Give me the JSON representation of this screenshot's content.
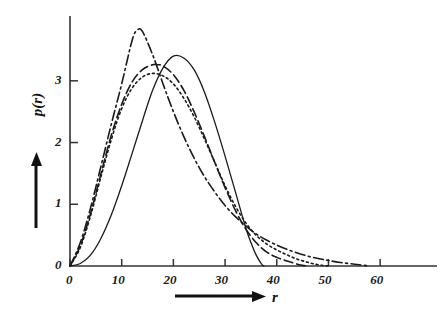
{
  "figure": {
    "background_color": "#ffffff",
    "line_color": "#1a1a1a",
    "axis_color": "#333333"
  },
  "axes": {
    "x_axis_label": "r",
    "y_axis_label": "p(r)",
    "x_ticks": [
      "0",
      "10",
      "20",
      "30",
      "40",
      "50",
      "60"
    ],
    "y_ticks": [
      "0",
      "1",
      "2",
      "3"
    ],
    "x_arrow_icon": "right-arrow-icon",
    "y_arrow_icon": "up-arrow-icon"
  },
  "chart_data": {
    "type": "line",
    "title": "",
    "xlabel": "r",
    "ylabel": "p(r)",
    "xlim": [
      0,
      71
    ],
    "ylim": [
      0,
      4.05
    ],
    "xticks": [
      0,
      10,
      20,
      30,
      40,
      50,
      60
    ],
    "yticks": [
      0,
      1,
      2,
      3
    ],
    "grid": false,
    "legend": "none",
    "series": [
      {
        "name": "solid",
        "style": "solid",
        "peak_x": 20,
        "peak_y": 3.4,
        "x": [
          0,
          2,
          4,
          6,
          8,
          10,
          12,
          14,
          16,
          18,
          20,
          22,
          24,
          26,
          28,
          30,
          32,
          34,
          35,
          36,
          37,
          37.5
        ],
        "values": [
          0,
          0.04,
          0.18,
          0.45,
          0.83,
          1.3,
          1.82,
          2.35,
          2.85,
          3.21,
          3.4,
          3.37,
          3.18,
          2.82,
          2.33,
          1.78,
          1.2,
          0.62,
          0.38,
          0.18,
          0.04,
          0
        ]
      },
      {
        "name": "dash-dot-tall",
        "style": "dash-dot",
        "peak_x": 13,
        "peak_y": 3.82,
        "x": [
          0,
          2,
          4,
          6,
          8,
          10,
          12,
          13,
          14,
          16,
          18,
          20,
          22,
          24,
          26,
          28,
          30,
          32,
          34,
          36,
          38,
          40,
          42,
          44,
          46,
          48,
          50,
          52,
          54,
          56,
          58
        ],
        "values": [
          0,
          0.38,
          0.95,
          1.62,
          2.3,
          2.95,
          3.65,
          3.82,
          3.8,
          3.42,
          2.95,
          2.5,
          2.1,
          1.75,
          1.45,
          1.2,
          0.98,
          0.8,
          0.65,
          0.52,
          0.42,
          0.34,
          0.27,
          0.21,
          0.16,
          0.12,
          0.09,
          0.06,
          0.04,
          0.02,
          0
        ]
      },
      {
        "name": "dashed",
        "style": "dashed",
        "peak_x": 17,
        "peak_y": 3.26,
        "x": [
          0,
          2,
          4,
          6,
          8,
          10,
          12,
          14,
          16,
          17,
          18,
          20,
          22,
          24,
          26,
          28,
          30,
          32,
          34,
          36,
          38,
          40,
          42,
          44,
          45,
          46
        ],
        "values": [
          0,
          0.33,
          0.86,
          1.5,
          2.12,
          2.62,
          2.98,
          3.18,
          3.26,
          3.26,
          3.24,
          3.1,
          2.85,
          2.5,
          2.1,
          1.68,
          1.27,
          0.9,
          0.6,
          0.38,
          0.23,
          0.14,
          0.08,
          0.03,
          0.01,
          0
        ]
      },
      {
        "name": "dotted",
        "style": "dotted",
        "peak_x": 16,
        "peak_y": 3.12,
        "x": [
          0,
          2,
          4,
          6,
          8,
          10,
          12,
          14,
          16,
          18,
          20,
          22,
          24,
          26,
          28,
          30,
          32,
          34,
          36,
          38,
          40,
          42,
          44,
          46,
          48,
          50
        ],
        "values": [
          0,
          0.3,
          0.82,
          1.45,
          2.05,
          2.55,
          2.88,
          3.06,
          3.12,
          3.08,
          2.95,
          2.72,
          2.42,
          2.06,
          1.68,
          1.3,
          0.97,
          0.7,
          0.5,
          0.36,
          0.26,
          0.18,
          0.11,
          0.06,
          0.02,
          0
        ]
      }
    ]
  }
}
